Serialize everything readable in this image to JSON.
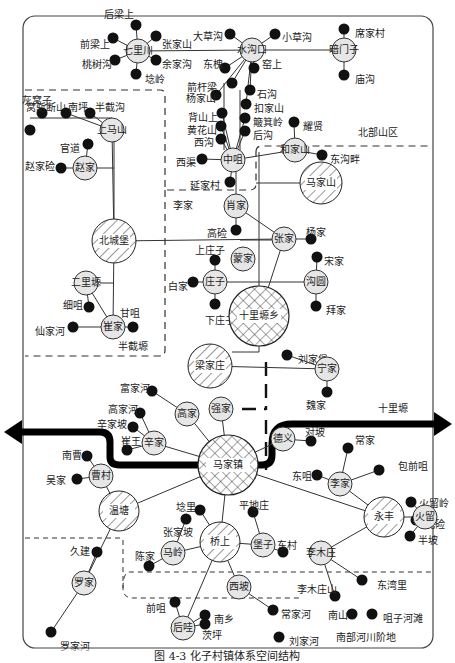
{
  "caption": "图 4-3  化子村镇体系空间结构",
  "regions": {
    "north": "北部山区",
    "west": "半截塬",
    "east": "十里塬",
    "south": "南部河川阶地"
  },
  "arrow_label": "十里塬",
  "colors": {
    "stroke": "#222222",
    "small_node_fill": "#e6e6e6",
    "dot": "#111111",
    "frame": "#444444"
  },
  "central_nodes": [
    {
      "id": "majiazhen",
      "label": "马家镇",
      "x": 228,
      "y": 465,
      "r": 30,
      "pattern": "cross"
    },
    {
      "id": "shilizhuixiang",
      "label": "十里塬乡",
      "x": 259,
      "y": 316,
      "r": 30,
      "pattern": "cross"
    }
  ],
  "hatched_nodes": [
    {
      "id": "beichengbu",
      "label": "北城堡",
      "x": 114,
      "y": 241,
      "r": 22
    },
    {
      "id": "majiashan",
      "label": "马家山",
      "x": 321,
      "y": 183,
      "r": 21
    },
    {
      "id": "liangjiazhuang",
      "label": "梁家庄",
      "x": 210,
      "y": 366,
      "r": 22
    },
    {
      "id": "wentang",
      "label": "温塘",
      "x": 119,
      "y": 511,
      "r": 20
    },
    {
      "id": "qiaoshang",
      "label": "桥上",
      "x": 220,
      "y": 542,
      "r": 20
    },
    {
      "id": "yongfeng",
      "label": "永丰",
      "x": 384,
      "y": 517,
      "r": 20
    }
  ],
  "minor_nodes": [
    {
      "id": "qilichuan",
      "label": "七里川",
      "x": 138,
      "y": 51
    },
    {
      "id": "shuigoukou",
      "label": "水沟口",
      "x": 252,
      "y": 50
    },
    {
      "id": "anmenzi",
      "label": "暗门子",
      "x": 344,
      "y": 50
    },
    {
      "id": "shangmashan",
      "label": "上马山",
      "x": 112,
      "y": 130
    },
    {
      "id": "zhaojia",
      "label": "赵家",
      "x": 85,
      "y": 168
    },
    {
      "id": "zhongzui",
      "label": "中咀",
      "x": 233,
      "y": 160
    },
    {
      "id": "hejiashan",
      "label": "和家山",
      "x": 295,
      "y": 150
    },
    {
      "id": "xiaojia",
      "label": "肖家",
      "x": 236,
      "y": 206
    },
    {
      "id": "zhangjia",
      "label": "张家",
      "x": 284,
      "y": 239
    },
    {
      "id": "mengjia",
      "label": "蒙家",
      "x": 243,
      "y": 259
    },
    {
      "id": "zhuangzi",
      "label": "庄子",
      "x": 215,
      "y": 282
    },
    {
      "id": "gouyuan",
      "label": "沟圆",
      "x": 316,
      "y": 282
    },
    {
      "id": "erlipo",
      "label": "二里塬",
      "x": 86,
      "y": 283
    },
    {
      "id": "cuijia",
      "label": "崔家",
      "x": 113,
      "y": 327
    },
    {
      "id": "ningjia",
      "label": "宁家",
      "x": 327,
      "y": 369
    },
    {
      "id": "gaojia",
      "label": "高家",
      "x": 187,
      "y": 414
    },
    {
      "id": "qiangjia",
      "label": "强家",
      "x": 221,
      "y": 409
    },
    {
      "id": "xinjia",
      "label": "辛家",
      "x": 154,
      "y": 443
    },
    {
      "id": "caocun",
      "label": "曹村",
      "x": 101,
      "y": 476
    },
    {
      "id": "deyi",
      "label": "德义",
      "x": 283,
      "y": 439
    },
    {
      "id": "lijia",
      "label": "李家",
      "x": 340,
      "y": 484
    },
    {
      "id": "huoliu",
      "label": "火留",
      "x": 425,
      "y": 517
    },
    {
      "id": "maling",
      "label": "马岭",
      "x": 173,
      "y": 553
    },
    {
      "id": "baozi",
      "label": "堡子",
      "x": 263,
      "y": 545
    },
    {
      "id": "limuzhuang",
      "label": "李木庄",
      "x": 321,
      "y": 553
    },
    {
      "id": "luojia",
      "label": "罗家",
      "x": 84,
      "y": 583
    },
    {
      "id": "xipo",
      "label": "西坡",
      "x": 239,
      "y": 587
    },
    {
      "id": "houwa",
      "label": "后哇",
      "x": 183,
      "y": 628
    }
  ],
  "villages": [
    {
      "label": "后梁上",
      "x": 136,
      "y": 25,
      "lx": 104,
      "ly": 14
    },
    {
      "label": "前梁上",
      "x": 113,
      "y": 38,
      "lx": 80,
      "ly": 44
    },
    {
      "label": "张家山",
      "x": 156,
      "y": 36,
      "lx": 162,
      "ly": 44
    },
    {
      "label": "桃树沟",
      "x": 115,
      "y": 60,
      "lx": 82,
      "ly": 64
    },
    {
      "label": "余家沟",
      "x": 156,
      "y": 60,
      "lx": 162,
      "ly": 64
    },
    {
      "label": "埝岭",
      "x": 136,
      "y": 74,
      "lx": 145,
      "ly": 79
    },
    {
      "label": "大草沟",
      "x": 230,
      "y": 34,
      "lx": 193,
      "ly": 36
    },
    {
      "label": "小草沟",
      "x": 275,
      "y": 34,
      "lx": 282,
      "ly": 37
    },
    {
      "label": "东槐",
      "x": 225,
      "y": 68,
      "lx": 203,
      "ly": 64
    },
    {
      "label": "窑上",
      "x": 254,
      "y": 68,
      "lx": 262,
      "ly": 64
    },
    {
      "label": "席家村",
      "x": 344,
      "y": 29,
      "lx": 355,
      "ly": 33
    },
    {
      "label": "庙沟",
      "x": 344,
      "y": 75,
      "lx": 355,
      "ly": 79
    },
    {
      "label": "箭杆梁",
      "x": 232,
      "y": 83,
      "lx": 187,
      "ly": 87
    },
    {
      "label": "杨家山",
      "x": 216,
      "y": 95,
      "lx": 186,
      "ly": 98
    },
    {
      "label": "石沟",
      "x": 250,
      "y": 90,
      "lx": 257,
      "ly": 94
    },
    {
      "label": "扣家山",
      "x": 246,
      "y": 104,
      "lx": 254,
      "ly": 108
    },
    {
      "label": "背山上",
      "x": 222,
      "y": 113,
      "lx": 188,
      "ly": 117
    },
    {
      "label": "簸箕岭",
      "x": 245,
      "y": 118,
      "lx": 253,
      "ly": 122
    },
    {
      "label": "黄花山",
      "x": 221,
      "y": 126,
      "lx": 187,
      "ly": 130
    },
    {
      "label": "后沟",
      "x": 245,
      "y": 131,
      "lx": 253,
      "ly": 135
    },
    {
      "label": "西沟",
      "x": 221,
      "y": 139,
      "lx": 194,
      "ly": 142
    },
    {
      "label": "耀贤",
      "x": 294,
      "y": 122,
      "lx": 303,
      "ly": 126
    },
    {
      "label": "西渠",
      "x": 202,
      "y": 159,
      "lx": 176,
      "ly": 162
    },
    {
      "label": "延家村",
      "x": 230,
      "y": 182,
      "lx": 190,
      "ly": 185
    },
    {
      "label": "东沟畔",
      "x": 322,
      "y": 155,
      "lx": 330,
      "ly": 159
    },
    {
      "label": "窝斩断山",
      "x": 42,
      "y": 113,
      "lx": 26,
      "ly": 107
    },
    {
      "label": "南坪",
      "x": 66,
      "y": 113,
      "lx": 68,
      "ly": 107
    },
    {
      "label": "半截沟",
      "x": 90,
      "y": 113,
      "lx": 95,
      "ly": 107
    },
    {
      "label": "灰窝子",
      "x": 30,
      "y": 130,
      "lx": 22,
      "ly": 100
    },
    {
      "label": "官道",
      "x": 88,
      "y": 144,
      "lx": 60,
      "ly": 148
    },
    {
      "label": "赵家硷",
      "x": 61,
      "y": 168,
      "lx": 25,
      "ly": 166
    },
    {
      "label": "高硷",
      "x": 236,
      "y": 230,
      "lx": 207,
      "ly": 233
    },
    {
      "label": "杨家",
      "x": 311,
      "y": 239,
      "lx": 306,
      "ly": 232
    },
    {
      "label": "宋家",
      "x": 317,
      "y": 257,
      "lx": 324,
      "ly": 261
    },
    {
      "label": "上庄子",
      "x": 215,
      "y": 260,
      "lx": 195,
      "ly": 250
    },
    {
      "label": "白家",
      "x": 193,
      "y": 282,
      "lx": 168,
      "ly": 286
    },
    {
      "label": "下庄子",
      "x": 215,
      "y": 304,
      "lx": 205,
      "ly": 320
    },
    {
      "label": "拜家",
      "x": 316,
      "y": 306,
      "lx": 326,
      "ly": 310
    },
    {
      "label": "细咀",
      "x": 89,
      "y": 307,
      "lx": 63,
      "ly": 305
    },
    {
      "label": "甘咀",
      "x": 133,
      "y": 327,
      "lx": 120,
      "ly": 313
    },
    {
      "label": "仙家河",
      "x": 73,
      "y": 327,
      "lx": 35,
      "ly": 331
    },
    {
      "label": "刘家堡",
      "x": 287,
      "y": 355,
      "lx": 298,
      "ly": 359
    },
    {
      "label": "魏家",
      "x": 327,
      "y": 392,
      "lx": 306,
      "ly": 405
    },
    {
      "label": "富家河",
      "x": 152,
      "y": 391,
      "lx": 120,
      "ly": 388
    },
    {
      "label": "高家河",
      "x": 140,
      "y": 413,
      "lx": 108,
      "ly": 409
    },
    {
      "label": "辛家坡",
      "x": 133,
      "y": 427,
      "lx": 97,
      "ly": 424
    },
    {
      "label": "崔王",
      "x": 127,
      "y": 450,
      "lx": 121,
      "ly": 441
    },
    {
      "label": "南曹",
      "x": 87,
      "y": 456,
      "lx": 62,
      "ly": 455
    },
    {
      "label": "吴家",
      "x": 77,
      "y": 479,
      "lx": 46,
      "ly": 480
    },
    {
      "label": "对坡",
      "x": 311,
      "y": 441,
      "lx": 305,
      "ly": 432
    },
    {
      "label": "常家",
      "x": 348,
      "y": 448,
      "lx": 355,
      "ly": 440
    },
    {
      "label": "包前咀",
      "x": 379,
      "y": 470,
      "lx": 398,
      "ly": 466
    },
    {
      "label": "东咀",
      "x": 317,
      "y": 475,
      "lx": 292,
      "ly": 476
    },
    {
      "label": "火留岭",
      "x": 411,
      "y": 502,
      "lx": 419,
      "ly": 503
    },
    {
      "label": "北硷",
      "x": 416,
      "y": 520,
      "lx": 425,
      "ly": 524
    },
    {
      "label": "半坡",
      "x": 410,
      "y": 536,
      "lx": 418,
      "ly": 540
    },
    {
      "label": "埝里",
      "x": 200,
      "y": 510,
      "lx": 176,
      "ly": 507
    },
    {
      "label": "平地庄",
      "x": 253,
      "y": 512,
      "lx": 239,
      "ly": 505
    },
    {
      "label": "张家坡",
      "x": 186,
      "y": 519,
      "lx": 163,
      "ly": 532
    },
    {
      "label": "东村",
      "x": 283,
      "y": 552,
      "lx": 277,
      "ly": 545
    },
    {
      "label": "陈家",
      "x": 149,
      "y": 566,
      "lx": 135,
      "ly": 556
    },
    {
      "label": "久建",
      "x": 97,
      "y": 552,
      "lx": 70,
      "ly": 551
    },
    {
      "label": "罗家河",
      "x": 51,
      "y": 632,
      "lx": 60,
      "ly": 646
    },
    {
      "label": "前咀",
      "x": 175,
      "y": 602,
      "lx": 146,
      "ly": 608
    },
    {
      "label": "南乡",
      "x": 205,
      "y": 615,
      "lx": 214,
      "ly": 619
    },
    {
      "label": "茨坪",
      "x": 205,
      "y": 624,
      "lx": 202,
      "ly": 635
    },
    {
      "label": "常家河",
      "x": 273,
      "y": 610,
      "lx": 281,
      "ly": 614
    },
    {
      "label": "刘家河",
      "x": 279,
      "y": 637,
      "lx": 289,
      "ly": 641
    },
    {
      "label": "李木庄山",
      "x": 335,
      "y": 596,
      "lx": 297,
      "ly": 589
    },
    {
      "label": "东湾里",
      "x": 362,
      "y": 580,
      "lx": 377,
      "ly": 585
    },
    {
      "label": "南山",
      "x": 352,
      "y": 614,
      "lx": 328,
      "ly": 615
    },
    {
      "label": "咀子河滩",
      "x": 372,
      "y": 614,
      "lx": 383,
      "ly": 618
    },
    {
      "label": "李家",
      "x": 196,
      "y": 200,
      "lx": 173,
      "ly": 205,
      "no_dot": true
    }
  ]
}
